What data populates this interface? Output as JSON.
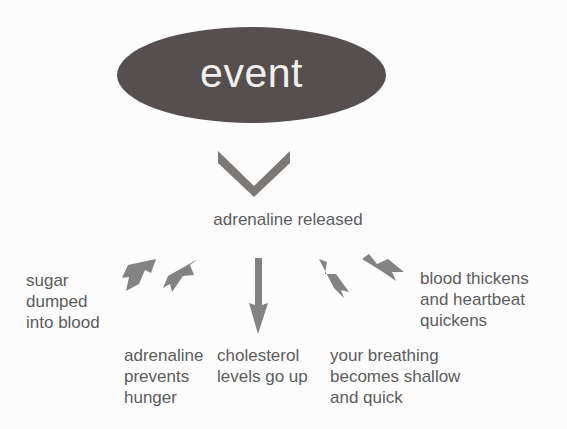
{
  "diagram": {
    "title": "event",
    "background_color": "#fcfcfc",
    "node_fill_color": "#554f4f",
    "node_text_color": "#f2f0ee",
    "arrow_color": "#7b7b7b",
    "label_text_color": "#5c5c5c",
    "root_node": {
      "label": "event",
      "shape": "ellipse"
    },
    "connector": {
      "name": "chevron-down",
      "label": ""
    },
    "intermediate_node": {
      "label": "adrenaline released"
    },
    "outcomes": [
      {
        "id": "sugar",
        "label": "sugar\ndumped\ninto blood",
        "arrow": "arrow-up-left"
      },
      {
        "id": "hunger",
        "label": "adrenaline\nprevents\nhunger",
        "arrow": "arrow-down-left"
      },
      {
        "id": "cholesterol",
        "label": "cholesterol\nlevels go up",
        "arrow": "arrow-down"
      },
      {
        "id": "breathing",
        "label": "your breathing\nbecomes shallow\nand quick",
        "arrow": "arrow-down-right"
      },
      {
        "id": "blood",
        "label": "blood thickens\nand heartbeat\nquickens",
        "arrow": "arrow-up-right"
      }
    ]
  }
}
